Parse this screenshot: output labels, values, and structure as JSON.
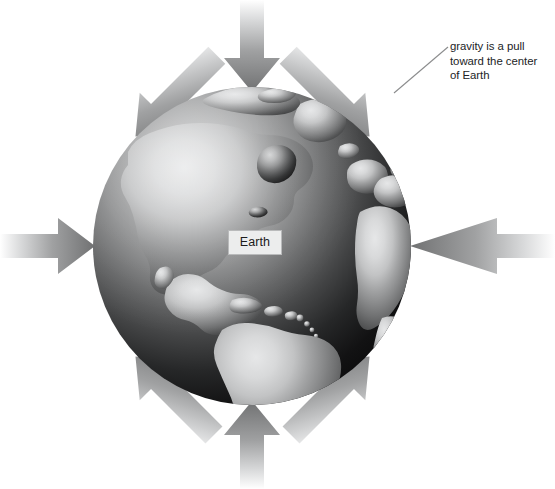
{
  "figure": {
    "width": 555,
    "height": 489,
    "background_color": "#ffffff"
  },
  "globe": {
    "label": "Earth",
    "center_x": 252,
    "center_y": 246,
    "radius": 159,
    "ocean_light_color": "#c9cacb",
    "ocean_dark_color": "#0b0b0b",
    "land_light_color": "#d7d8d9",
    "land_dark_color": "#131313",
    "land_mid_color": "#8c8d8e"
  },
  "earth_label_box": {
    "text": "Earth",
    "fill_color": "#eceded",
    "border_color": "#b9babb"
  },
  "annotation": {
    "lines": [
      "gravity is a pull",
      "toward the center",
      "of Earth"
    ],
    "line1": "gravity is a pull",
    "line2": "toward the center",
    "line3": "of Earth",
    "text_color": "#222326",
    "leader_line": {
      "from_x": 448,
      "from_y": 47,
      "to_x": 394,
      "to_y": 93,
      "color": "#8b8c8d"
    }
  },
  "arrows": {
    "count": 8,
    "description": "Eight gray gradient arrows pointing inward toward the center of Earth from all directions",
    "head_color": "#7b7c7d",
    "tail_color": "#ffffff",
    "items": [
      {
        "name": "arrow-top",
        "direction": "down",
        "angle_deg": 90
      },
      {
        "name": "arrow-top-right",
        "direction": "down-left",
        "angle_deg": 135
      },
      {
        "name": "arrow-right",
        "direction": "left",
        "angle_deg": 180
      },
      {
        "name": "arrow-bottom-right",
        "direction": "up-left",
        "angle_deg": 225
      },
      {
        "name": "arrow-bottom",
        "direction": "up",
        "angle_deg": 270
      },
      {
        "name": "arrow-bottom-left",
        "direction": "up-right",
        "angle_deg": 315
      },
      {
        "name": "arrow-left",
        "direction": "right",
        "angle_deg": 0
      },
      {
        "name": "arrow-top-left",
        "direction": "down-right",
        "angle_deg": 45
      }
    ]
  }
}
